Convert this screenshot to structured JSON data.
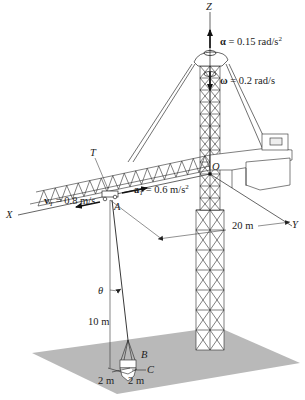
{
  "figure": {
    "axes": {
      "x": "X",
      "y": "Y",
      "z": "Z",
      "origin": "O"
    },
    "points": {
      "trolley": "T",
      "hook": "A",
      "bucket": "B",
      "ground_point": "C"
    },
    "annotations": {
      "alpha_sym": "α",
      "alpha_text": " = 0.15 rad/s",
      "alpha_exp": "2",
      "omega_sym": "ω",
      "omega_text": " = 0.2 rad/s",
      "aT_sym": "a",
      "aT_sub": "T",
      "aT_text": " = 0.6 m/s",
      "aT_exp": "2",
      "vT_sym": "v",
      "vT_sub": "T",
      "vT_text": " = 0.8 m/s",
      "dist_OA": "20 m",
      "theta": "θ",
      "height": "10 m",
      "dim_left": "2 m",
      "dim_right": "2 m"
    },
    "colors": {
      "ground": "#b9b9b9",
      "line": "#2a2a2a"
    }
  }
}
